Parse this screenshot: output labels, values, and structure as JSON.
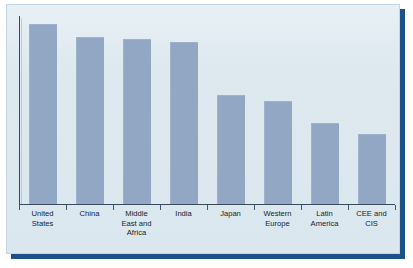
{
  "chart_data": {
    "type": "bar",
    "title": "",
    "subtitle": "",
    "xlabel": "",
    "ylabel": "",
    "grid": false,
    "legend": false,
    "axis": {
      "y_visible": true,
      "y_ticklabels": [],
      "x_visible": true,
      "x_ticks": 9,
      "ylim": [
        0,
        100
      ]
    },
    "categories": [
      "United States",
      "China",
      "Middle East and Africa",
      "India",
      "Japan",
      "Western Europe",
      "Latin America",
      "CEE and CIS"
    ],
    "category_lines": [
      [
        "United",
        "States"
      ],
      [
        "China"
      ],
      [
        "Middle",
        "East and",
        "Africa"
      ],
      [
        "India"
      ],
      [
        "Japan"
      ],
      [
        "Western",
        "Europe"
      ],
      [
        "Latin",
        "America"
      ],
      [
        "CEE and",
        "CIS"
      ]
    ],
    "values": [
      96,
      89,
      88,
      86,
      58,
      55,
      43,
      37
    ],
    "bar_color": "#92a7c4",
    "background_color": "#dfeaf0",
    "frame_color": "#1d5289",
    "axis_color": "#3a4a58",
    "label_color": "#16212c"
  },
  "figure": {
    "name": "bar-chart-energy-demand-by-region"
  }
}
